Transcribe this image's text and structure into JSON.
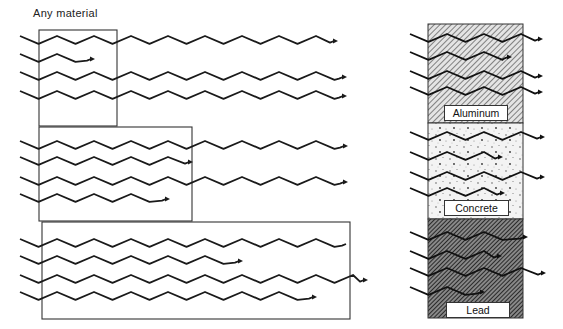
{
  "left_panel": {
    "title": "Any material",
    "boxes": [
      {
        "name": "box-thin",
        "x": 39,
        "y": 30,
        "w": 78,
        "h": 96
      },
      {
        "name": "box-medium",
        "x": 39,
        "y": 127,
        "w": 153,
        "h": 94
      },
      {
        "name": "box-thick",
        "x": 42,
        "y": 222,
        "w": 308,
        "h": 97
      }
    ],
    "waves": [
      {
        "y": 42,
        "x0": 20,
        "x1": 338,
        "arrow": true
      },
      {
        "y": 60,
        "x0": 20,
        "x1": 95,
        "arrow": true
      },
      {
        "y": 78,
        "x0": 20,
        "x1": 347,
        "arrow": true
      },
      {
        "y": 97,
        "x0": 20,
        "x1": 347,
        "arrow": true
      },
      {
        "y": 147,
        "x0": 20,
        "x1": 348,
        "arrow": true
      },
      {
        "y": 163,
        "x0": 20,
        "x1": 193,
        "arrow": true
      },
      {
        "y": 183,
        "x0": 20,
        "x1": 348,
        "arrow": true
      },
      {
        "y": 200,
        "x0": 20,
        "x1": 170,
        "arrow": true
      },
      {
        "y": 245,
        "x0": 20,
        "x1": 350,
        "arrow": false
      },
      {
        "y": 262,
        "x0": 20,
        "x1": 243,
        "arrow": true
      },
      {
        "y": 281,
        "x0": 20,
        "x1": 368,
        "arrow": true
      },
      {
        "y": 298,
        "x0": 20,
        "x1": 317,
        "arrow": true
      }
    ]
  },
  "right_panel": {
    "x": 428,
    "w": 95,
    "materials": [
      {
        "name": "Aluminum",
        "y": 24,
        "h": 99,
        "pattern": "hatch-light",
        "label_box": {
          "x": 444,
          "y": 105,
          "w": 64,
          "h": 16
        },
        "waves": [
          {
            "y": 40,
            "x0": 410,
            "x1": 543,
            "arrow": true
          },
          {
            "y": 58,
            "x0": 410,
            "x1": 512,
            "arrow": true
          },
          {
            "y": 77,
            "x0": 410,
            "x1": 543,
            "arrow": true
          },
          {
            "y": 93,
            "x0": 410,
            "x1": 543,
            "arrow": true
          }
        ]
      },
      {
        "name": "Concrete",
        "y": 123,
        "h": 96,
        "pattern": "stipple",
        "label_box": {
          "x": 444,
          "y": 200,
          "w": 65,
          "h": 16
        },
        "waves": [
          {
            "y": 138,
            "x0": 410,
            "x1": 545,
            "arrow": true
          },
          {
            "y": 158,
            "x0": 410,
            "x1": 503,
            "arrow": true
          },
          {
            "y": 178,
            "x0": 410,
            "x1": 545,
            "arrow": true
          },
          {
            "y": 194,
            "x0": 410,
            "x1": 505,
            "arrow": true
          }
        ]
      },
      {
        "name": "Lead",
        "y": 219,
        "h": 99,
        "pattern": "hatch-dense",
        "label_box": {
          "x": 446,
          "y": 302,
          "w": 64,
          "h": 16
        },
        "waves": [
          {
            "y": 238,
            "x0": 410,
            "x1": 528,
            "arrow": true
          },
          {
            "y": 257,
            "x0": 410,
            "x1": 502,
            "arrow": true
          },
          {
            "y": 274,
            "x0": 410,
            "x1": 546,
            "arrow": true
          },
          {
            "y": 293,
            "x0": 410,
            "x1": 485,
            "arrow": true
          }
        ]
      }
    ]
  },
  "colors": {
    "line": "#1a1a1a",
    "box": "#333333",
    "hatch": "#555555",
    "hatch_dense": "#222222"
  }
}
